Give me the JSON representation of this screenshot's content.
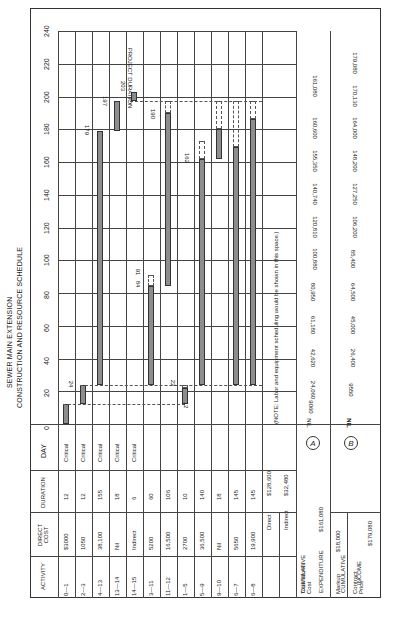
{
  "title": {
    "line1": "SEWER MAIN EXTENSION",
    "line2": "CONSTRUCTION AND RESOURCE SCHEDULE"
  },
  "table_headers": {
    "activity": "ACTIVITY",
    "direct_cost": "DIRECT COST",
    "duration": "DURATION",
    "day": "DAY"
  },
  "day_axis_ticks": [
    "0",
    "20",
    "40",
    "60",
    "80",
    "100",
    "120",
    "140",
    "160",
    "180",
    "200",
    "220",
    "240"
  ],
  "activities": [
    {
      "activity": "0—1",
      "direct_cost": "$3000",
      "duration": "12",
      "day": "Critical",
      "start": 0,
      "end": 12
    },
    {
      "activity": "2—3",
      "direct_cost": "1050",
      "duration": "12",
      "day": "Critical",
      "start": 12,
      "end": 24
    },
    {
      "activity": "4—13",
      "direct_cost": "38,100",
      "duration": "155",
      "day": "Critical",
      "start": 24,
      "end": 179
    },
    {
      "activity": "13—14",
      "direct_cost": "Nil",
      "duration": "18",
      "day": "Critical",
      "start": 179,
      "end": 197
    },
    {
      "activity": "14—15",
      "direct_cost": "Indirect",
      "duration": "6",
      "day": "Critical",
      "start": 197,
      "end": 203
    },
    {
      "activity": "3—11",
      "direct_cost": "5200",
      "duration": "60",
      "day": "",
      "start": 24,
      "end": 84
    },
    {
      "activity": "11—12",
      "direct_cost": "16,500",
      "duration": "106",
      "day": "",
      "start": 84,
      "end": 190
    },
    {
      "activity": "1—5",
      "direct_cost": "2700",
      "duration": "10",
      "day": "",
      "start": 12,
      "end": 22
    },
    {
      "activity": "5—9",
      "direct_cost": "36,500",
      "duration": "140",
      "day": "",
      "start": 24,
      "end": 162
    },
    {
      "activity": "9—10",
      "direct_cost": "Nil",
      "duration": "18",
      "day": "",
      "start": 162,
      "end": 180
    },
    {
      "activity": "6—7",
      "direct_cost": "5650",
      "duration": "145",
      "day": "",
      "start": 24,
      "end": 169
    },
    {
      "activity": "6—8",
      "direct_cost": "19,900",
      "duration": "145",
      "day": "",
      "start": 24,
      "end": 186
    }
  ],
  "bar_labels": {
    "l12": "12",
    "l22": "22",
    "l24": "24",
    "l84": "84",
    "l91": "91",
    "l162": "162",
    "l179": "179",
    "l190": "190",
    "l197": "197",
    "l203": "203",
    "project_duration": "PROJECT DURATION"
  },
  "totals": {
    "direct_label": "Direct",
    "direct_value": "$128,600",
    "indirect_label": "Indirect",
    "indirect_value": "$32,480",
    "total_label": "Total Works Cost",
    "total_value": "$161,080",
    "markup_label": "Markup",
    "markup_value": "$18,000",
    "contract_label": "Contract Price",
    "contract_value": "$179,080"
  },
  "note": "(NOTE: Labor and equipment scheduling would be shown in this space.)",
  "cumulative_expenditure": {
    "label_top": "CUMULATIVE",
    "label_bottom": "EXPENDITURE",
    "marker": "A",
    "values": [
      "NIL",
      "9060",
      "24,060",
      "42,620",
      "61,180",
      "80,950",
      "100,880",
      "120,810",
      "140,740",
      "155,350",
      "160,600",
      "161,080"
    ],
    "currency": "$"
  },
  "cumulative_income": {
    "label_top": "CUMULATIVE",
    "label_bottom": "INCOME",
    "marker": "B",
    "values": [
      "NIL",
      "NIL",
      "9550",
      "26,400",
      "45,000",
      "64,500",
      "85,400",
      "106,200",
      "127,250",
      "148,200",
      "164,000",
      "170,130",
      "179,080"
    ],
    "currency": "$"
  }
}
